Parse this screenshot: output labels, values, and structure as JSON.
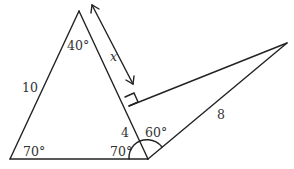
{
  "diagram": {
    "type": "geometry",
    "labels": {
      "apex_angle": "40°",
      "left_base_angle": "70°",
      "right_base_angle": "70°",
      "adjacent_angle": "60°",
      "left_side": "10",
      "lower_right_segment": "4",
      "long_side": "8",
      "unknown": "x"
    },
    "colors": {
      "line": "#222222",
      "text": "#333333",
      "background": "#ffffff"
    }
  }
}
